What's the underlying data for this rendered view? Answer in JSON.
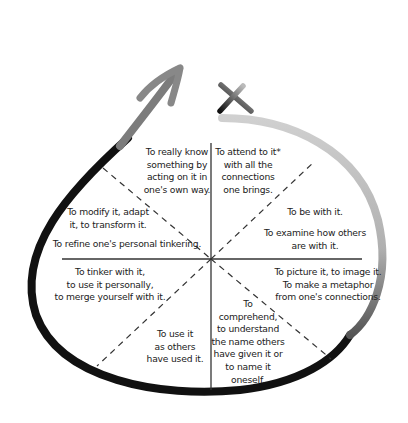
{
  "diagram": {
    "type": "circular-cycle",
    "markers": {
      "arrow": "arrow-head-icon",
      "cross": "x-mark-icon"
    },
    "colors": {
      "stroke": "#1a1a1a",
      "stroke_fade": "#c8c8c8",
      "text": "#222222"
    },
    "sectors": [
      {
        "id": "upper-left-inner",
        "text": "To really know\nsomething by\nacting on it in\none's own way."
      },
      {
        "id": "upper-right-inner",
        "text": "To attend to it*\nwith all the\nconnections\none brings."
      },
      {
        "id": "upper-right-outer",
        "text": "To be with it."
      },
      {
        "id": "upper-right-outer-2",
        "text": "To examine how others\nare with it."
      },
      {
        "id": "upper-left-outer",
        "text": "To modify it, adapt\nit, to transform it."
      },
      {
        "id": "upper-left-outer-2",
        "text": "To refine one's personal tinkering."
      },
      {
        "id": "lower-left-outer",
        "text": "To tinker with it,\nto use it personally,\nto merge yourself with it."
      },
      {
        "id": "lower-right-outer",
        "text": "To picture it, to image it.\nTo make a metaphor\nfrom one's connections."
      },
      {
        "id": "lower-left-inner",
        "text": "To use it\nas others\nhave used it."
      },
      {
        "id": "lower-right-inner",
        "text": "To\ncomprehend,\nto understand\nthe name others\nhave given it or\nto name it\noneself."
      }
    ]
  }
}
